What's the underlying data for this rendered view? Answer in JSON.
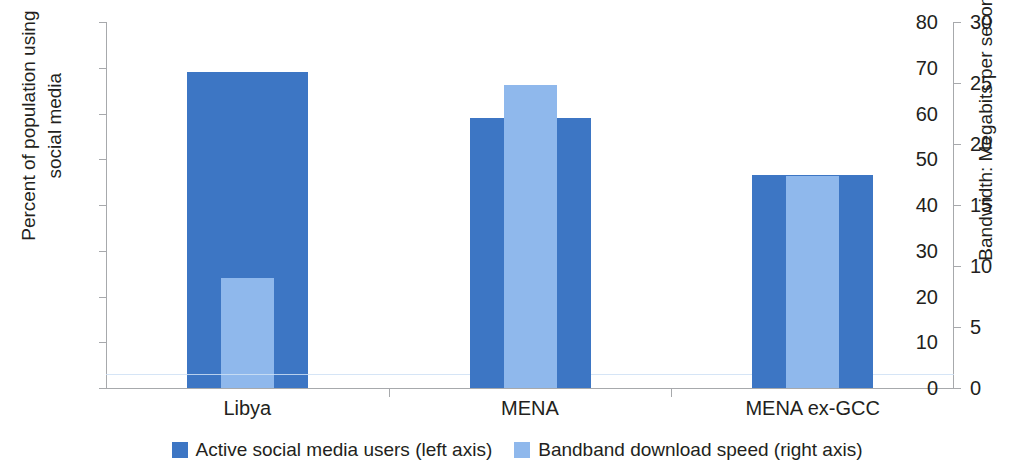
{
  "chart_data": {
    "type": "bar",
    "title": "",
    "subtitle": "",
    "categories": [
      "Libya",
      "MENA",
      "MENA ex-GCC"
    ],
    "series": [
      {
        "name": "Active social media users (left axis)",
        "axis": "left",
        "color": "#3d76c4",
        "values": [
          69.1,
          59.0,
          46.6
        ],
        "unit": "percent"
      },
      {
        "name": "Bandband download speed (right axis)",
        "axis": "right",
        "color": "#8fb8ec",
        "values": [
          9.0,
          24.8,
          17.4
        ],
        "unit": "Mbps"
      }
    ],
    "xlabel": "",
    "ylabel": "Percent of population using social media",
    "y2label": "Bandwidth: Megabits per second",
    "ylim": [
      0,
      80
    ],
    "y2lim": [
      0,
      30
    ],
    "yticks": [
      0,
      10,
      20,
      30,
      40,
      50,
      60,
      70,
      80
    ],
    "y2ticks": [
      0,
      5,
      10,
      15,
      20,
      25,
      30
    ],
    "grid": false,
    "legend_position": "bottom"
  },
  "axes": {
    "left": {
      "title": "Percent of population using\nsocial media",
      "ticks": [
        "80",
        "70",
        "60",
        "50",
        "40",
        "30",
        "20",
        "10",
        "0"
      ]
    },
    "right": {
      "title": "Bandwidth: Megabits per second",
      "ticks": [
        "30",
        "25",
        "20",
        "15",
        "10",
        "5",
        "0"
      ]
    }
  },
  "categories": [
    {
      "label": "Libya",
      "primary": 69.1,
      "secondary": 9.0
    },
    {
      "label": "MENA",
      "primary": 59.0,
      "secondary": 24.8
    },
    {
      "label": "MENA ex-GCC",
      "primary": 46.6,
      "secondary": 17.4
    }
  ],
  "legend": {
    "items": [
      {
        "label": "Active social media users (left axis)",
        "color": "#3d76c4"
      },
      {
        "label": "Bandband download speed (right axis)",
        "color": "#8fb8ec"
      }
    ]
  },
  "colors": {
    "primary": "#3d76c4",
    "secondary": "#8fb8ec",
    "axis": "#a7a9ac",
    "text": "#231f20",
    "background": "#ffffff"
  }
}
